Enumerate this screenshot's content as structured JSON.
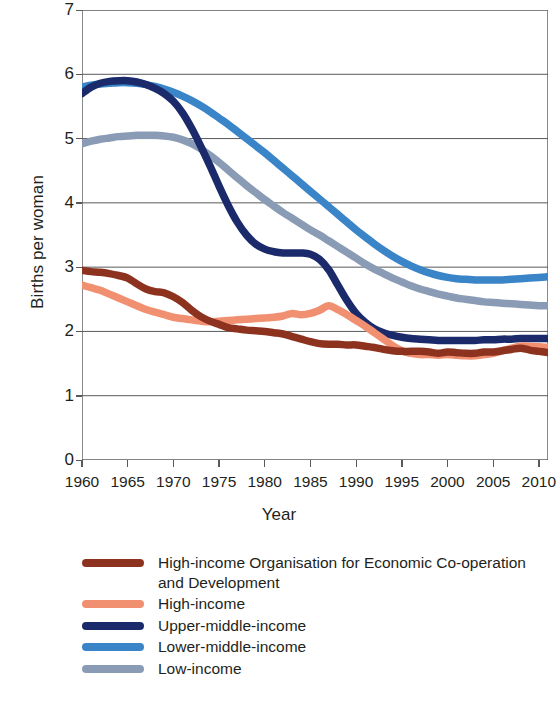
{
  "chart_data": {
    "type": "line",
    "title": "",
    "xlabel": "Year",
    "ylabel": "Births per woman",
    "xlim": [
      1960,
      2011
    ],
    "ylim": [
      0,
      7
    ],
    "yticks": [
      0,
      1,
      2,
      3,
      4,
      5,
      6,
      7
    ],
    "xticks": [
      1960,
      1965,
      1970,
      1975,
      1980,
      1985,
      1990,
      1995,
      2000,
      2005,
      2010
    ],
    "grid": "horizontal",
    "legend_position": "below",
    "x": [
      1960,
      1961,
      1962,
      1963,
      1964,
      1965,
      1966,
      1967,
      1968,
      1969,
      1970,
      1971,
      1972,
      1973,
      1974,
      1975,
      1976,
      1977,
      1978,
      1979,
      1980,
      1981,
      1982,
      1983,
      1984,
      1985,
      1986,
      1987,
      1988,
      1989,
      1990,
      1991,
      1992,
      1993,
      1994,
      1995,
      1996,
      1997,
      1998,
      1999,
      2000,
      2001,
      2002,
      2003,
      2004,
      2005,
      2006,
      2007,
      2008,
      2009,
      2010,
      2011
    ],
    "series": [
      {
        "name": "High-income Organisation for Economic Co-operation and Development",
        "color": "#8e3220",
        "values": [
          2.95,
          2.93,
          2.92,
          2.9,
          2.87,
          2.83,
          2.74,
          2.66,
          2.62,
          2.6,
          2.54,
          2.45,
          2.33,
          2.23,
          2.16,
          2.11,
          2.06,
          2.04,
          2.02,
          2.01,
          2.0,
          1.98,
          1.96,
          1.92,
          1.88,
          1.84,
          1.81,
          1.8,
          1.8,
          1.79,
          1.79,
          1.77,
          1.75,
          1.72,
          1.7,
          1.69,
          1.69,
          1.69,
          1.68,
          1.66,
          1.68,
          1.67,
          1.66,
          1.66,
          1.68,
          1.68,
          1.7,
          1.72,
          1.74,
          1.71,
          1.69,
          1.67
        ]
      },
      {
        "name": "High-income",
        "color": "#f09070",
        "values": [
          2.72,
          2.68,
          2.64,
          2.58,
          2.52,
          2.46,
          2.4,
          2.34,
          2.3,
          2.26,
          2.22,
          2.2,
          2.18,
          2.16,
          2.15,
          2.16,
          2.17,
          2.18,
          2.19,
          2.2,
          2.21,
          2.22,
          2.24,
          2.28,
          2.26,
          2.28,
          2.33,
          2.4,
          2.34,
          2.26,
          2.17,
          2.08,
          1.98,
          1.88,
          1.78,
          1.7,
          1.66,
          1.64,
          1.64,
          1.63,
          1.64,
          1.63,
          1.62,
          1.62,
          1.64,
          1.66,
          1.7,
          1.74,
          1.77,
          1.77,
          1.76,
          1.75
        ]
      },
      {
        "name": "Upper-middle-income",
        "color": "#1b2a6b",
        "values": [
          5.7,
          5.8,
          5.86,
          5.89,
          5.9,
          5.9,
          5.88,
          5.84,
          5.78,
          5.7,
          5.58,
          5.4,
          5.16,
          4.88,
          4.58,
          4.26,
          3.96,
          3.7,
          3.5,
          3.36,
          3.28,
          3.24,
          3.22,
          3.22,
          3.22,
          3.2,
          3.12,
          2.96,
          2.72,
          2.48,
          2.28,
          2.14,
          2.04,
          1.98,
          1.94,
          1.91,
          1.89,
          1.88,
          1.87,
          1.86,
          1.86,
          1.86,
          1.86,
          1.86,
          1.87,
          1.87,
          1.88,
          1.88,
          1.89,
          1.89,
          1.89,
          1.89
        ]
      },
      {
        "name": "Lower-middle-income",
        "color": "#3a84c8",
        "values": [
          5.8,
          5.83,
          5.85,
          5.86,
          5.87,
          5.87,
          5.86,
          5.84,
          5.81,
          5.77,
          5.72,
          5.66,
          5.59,
          5.51,
          5.42,
          5.32,
          5.22,
          5.11,
          5.0,
          4.89,
          4.78,
          4.66,
          4.54,
          4.42,
          4.3,
          4.18,
          4.06,
          3.94,
          3.82,
          3.7,
          3.58,
          3.47,
          3.36,
          3.26,
          3.17,
          3.09,
          3.02,
          2.96,
          2.91,
          2.87,
          2.84,
          2.82,
          2.81,
          2.8,
          2.8,
          2.8,
          2.8,
          2.81,
          2.82,
          2.83,
          2.84,
          2.85
        ]
      },
      {
        "name": "Low-income",
        "color": "#8a9bb5",
        "values": [
          4.92,
          4.96,
          4.99,
          5.01,
          5.03,
          5.04,
          5.05,
          5.05,
          5.05,
          5.04,
          5.02,
          4.98,
          4.92,
          4.84,
          4.74,
          4.63,
          4.51,
          4.39,
          4.27,
          4.16,
          4.05,
          3.95,
          3.85,
          3.76,
          3.67,
          3.58,
          3.5,
          3.41,
          3.32,
          3.23,
          3.14,
          3.05,
          2.97,
          2.9,
          2.83,
          2.77,
          2.71,
          2.66,
          2.62,
          2.58,
          2.55,
          2.52,
          2.5,
          2.48,
          2.46,
          2.45,
          2.44,
          2.43,
          2.42,
          2.41,
          2.4,
          2.4
        ]
      }
    ]
  },
  "legend": {
    "items": [
      {
        "label": "High-income Organisation for Economic Co-operation and Development",
        "color": "#8e3220"
      },
      {
        "label": "High-income",
        "color": "#f09070"
      },
      {
        "label": "Upper-middle-income",
        "color": "#1b2a6b"
      },
      {
        "label": "Lower-middle-income",
        "color": "#3a84c8"
      },
      {
        "label": "Low-income",
        "color": "#8a9bb5"
      }
    ]
  }
}
